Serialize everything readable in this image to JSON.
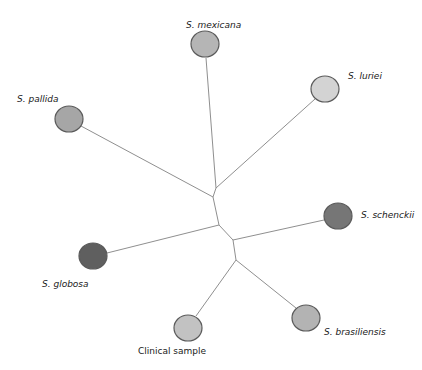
{
  "diagram": {
    "type": "unrooted-phylogenetic-tree",
    "colors": {
      "branch": "#8f8f8f",
      "node_stroke": "#5a5a5a",
      "light_gray": "#cfcfcf",
      "medium_gray": "#a9a9a9",
      "dark_gray": "#6e6e6e"
    },
    "internal_nodes": [
      {
        "id": "n1",
        "x": 216,
        "y": 188
      },
      {
        "id": "n2",
        "x": 213,
        "y": 197
      },
      {
        "id": "n3",
        "x": 219,
        "y": 225
      },
      {
        "id": "n4",
        "x": 233,
        "y": 240
      },
      {
        "id": "n5",
        "x": 236,
        "y": 260
      }
    ],
    "branches": [
      {
        "from": "n1",
        "to": "mexicana"
      },
      {
        "from": "n1",
        "to": "luriei"
      },
      {
        "from": "n1",
        "to": "n2"
      },
      {
        "from": "n2",
        "to": "pallida"
      },
      {
        "from": "n2",
        "to": "n3"
      },
      {
        "from": "n3",
        "to": "globosa"
      },
      {
        "from": "n3",
        "to": "n4"
      },
      {
        "from": "n4",
        "to": "schenckii"
      },
      {
        "from": "n4",
        "to": "n5"
      },
      {
        "from": "n5",
        "to": "clinical"
      },
      {
        "from": "n5",
        "to": "brasiliensis"
      }
    ],
    "leaves": [
      {
        "id": "mexicana",
        "label": "S. mexicana",
        "italic": true,
        "cx": 205,
        "cy": 44,
        "r": 14,
        "fill": "#b5b5b5",
        "label_x": 186,
        "label_y": 20,
        "branch_x": 206,
        "branch_y": 58
      },
      {
        "id": "luriei",
        "label": "S. luriei",
        "italic": true,
        "cx": 325,
        "cy": 89,
        "r": 14,
        "fill": "#d3d3d3",
        "label_x": 348,
        "label_y": 71,
        "branch_x": 315,
        "branch_y": 99
      },
      {
        "id": "pallida",
        "label": "S. pallida",
        "italic": true,
        "cx": 69,
        "cy": 119,
        "r": 14,
        "fill": "#a6a6a6",
        "label_x": 17,
        "label_y": 94,
        "branch_x": 81,
        "branch_y": 126
      },
      {
        "id": "schenckii",
        "label": "S. schenckii",
        "italic": true,
        "cx": 338,
        "cy": 216,
        "r": 14,
        "fill": "#767676",
        "label_x": 361,
        "label_y": 210,
        "branch_x": 324,
        "branch_y": 220
      },
      {
        "id": "globosa",
        "label": "S. globosa",
        "italic": true,
        "cx": 93,
        "cy": 256,
        "r": 14,
        "fill": "#5f5f5f",
        "label_x": 42,
        "label_y": 279,
        "branch_x": 107,
        "branch_y": 253
      },
      {
        "id": "clinical",
        "label": "Clinical sample",
        "italic": false,
        "cx": 188,
        "cy": 328,
        "r": 14,
        "fill": "#c2c2c2",
        "label_x": 138,
        "label_y": 346,
        "branch_x": 196,
        "branch_y": 316
      },
      {
        "id": "brasiliensis",
        "label": "S. brasiliensis",
        "italic": true,
        "cx": 306,
        "cy": 318,
        "r": 14,
        "fill": "#b3b3b3",
        "label_x": 324,
        "label_y": 327,
        "branch_x": 296,
        "branch_y": 308
      }
    ]
  }
}
